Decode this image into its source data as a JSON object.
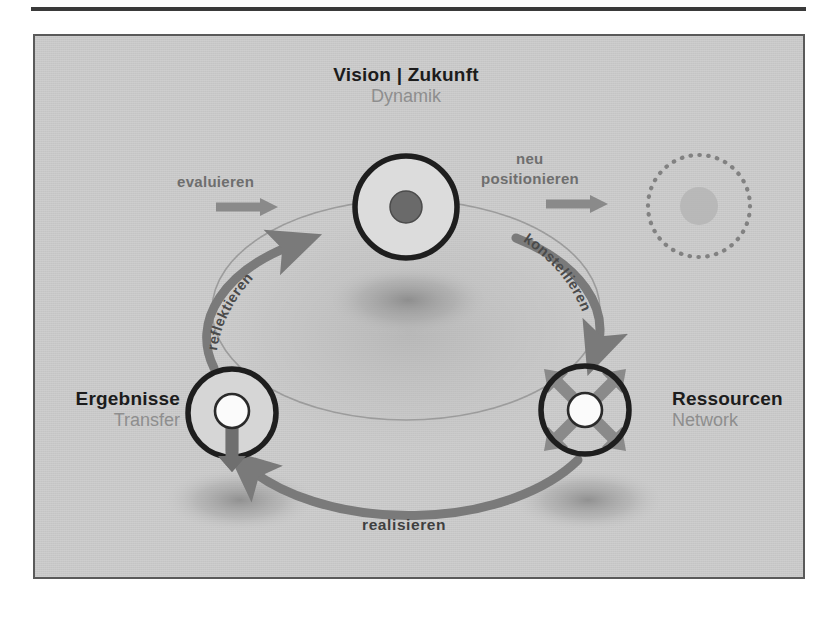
{
  "diagram": {
    "title_node": {
      "main": "Vision  |  Zukunft",
      "sub": "Dynamik"
    },
    "left_node": {
      "main": "Ergebnisse",
      "sub": "Transfer"
    },
    "right_node": {
      "main": "Ressourcen",
      "sub": "Network"
    },
    "arrows": {
      "evaluieren": "evaluieren",
      "neu": "neu",
      "positionieren": "positionieren",
      "reflektieren": "reflektieren",
      "konstellieren": "konstellieren",
      "realisieren": "realisieren"
    },
    "colors": {
      "panel_bg": "#c8c8c8",
      "page_bg": "#ffffff",
      "panel_border": "#5a5a5a",
      "rule": "#3a3a3a",
      "node_ring": "#1e1e1e",
      "node_fill": "#d6d6d6",
      "node_core_dark": "#6a6a6a",
      "node_core_light": "#fbfbfb",
      "arc_thin": "#9a9a9a",
      "arc_thick": "#7a7a7a",
      "arrow_gray": "#8a8a8a",
      "arrow_dark": "#6f6f6f",
      "label_main": "#1c1c1c",
      "label_sub": "#8e8e8e",
      "ghost_dots": "#7d7d7d"
    },
    "icons": {
      "ghost_circle": "dotted-circle-icon",
      "left_updown": "up-down-double-arrow-icon",
      "right_radial": "four-way-diagonal-arrow-icon"
    }
  }
}
